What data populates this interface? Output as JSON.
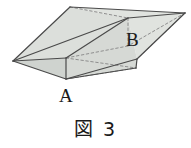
{
  "figure": {
    "caption": "図 3",
    "labels": {
      "a": "A",
      "b": "B"
    },
    "colors": {
      "face_fill": "#d9dcd8",
      "face_fill_light": "#e2e5e1",
      "face_fill_dark": "#cfd3cf",
      "edge": "#4a4a4a",
      "hidden_edge": "#8a8a8a",
      "text": "#1a1a1a",
      "background": "#ffffff"
    },
    "shape_description": "oblique prism",
    "geometry": {
      "left_apex": [
        13,
        61
      ],
      "front_bottom_vertex": [
        66,
        79
      ],
      "front_top_vertex": [
        66,
        58
      ],
      "top_apex": [
        70,
        7
      ],
      "ridge_right_vertex": [
        128,
        18
      ],
      "right_apex": [
        185,
        13
      ],
      "right_bottom_vertex": [
        136,
        68
      ],
      "bottom_right_corner": [
        137,
        60
      ]
    }
  }
}
